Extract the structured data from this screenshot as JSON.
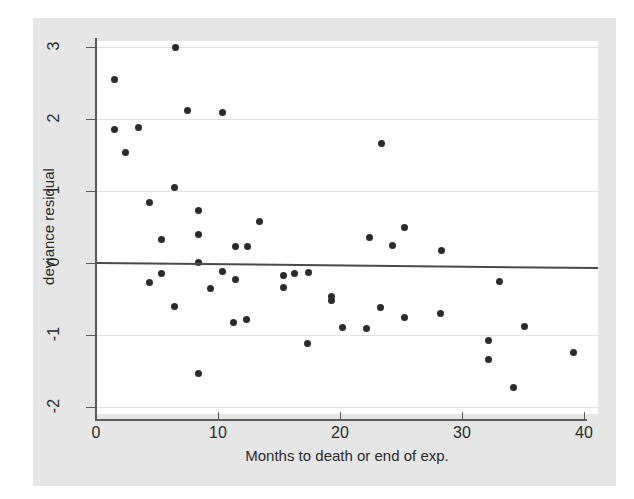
{
  "chart_data": {
    "type": "scatter",
    "title": "",
    "xlabel": "Months to death or end of exp.",
    "ylabel": "deviance residual",
    "xlim": [
      0,
      41.2
    ],
    "ylim": [
      -2.2,
      3.15
    ],
    "xticks": [
      0,
      10,
      20,
      30,
      40
    ],
    "xticklabels": [
      "0",
      "10",
      "20",
      "30",
      "40"
    ],
    "yticks": [
      3,
      2,
      1,
      0,
      -1,
      -2
    ],
    "yticklabels": [
      "3",
      "2",
      "1",
      "0",
      "-1",
      "-2"
    ],
    "grid": "horizontal",
    "legend": "none",
    "reference_line": {
      "name": "zero-reference-line",
      "y_left": 0.0,
      "y_right": -0.07,
      "color": "#4a4a4a"
    },
    "marker": {
      "shape": "circle",
      "color": "#2b2b2b",
      "size": 7
    },
    "points": [
      {
        "x": 1.5,
        "y": 2.55
      },
      {
        "x": 1.5,
        "y": 1.85
      },
      {
        "x": 2.4,
        "y": 1.53
      },
      {
        "x": 3.5,
        "y": 1.88
      },
      {
        "x": 4.4,
        "y": 0.84
      },
      {
        "x": 4.4,
        "y": -0.27
      },
      {
        "x": 5.4,
        "y": 0.33
      },
      {
        "x": 5.4,
        "y": -0.15
      },
      {
        "x": 6.4,
        "y": 1.05
      },
      {
        "x": 6.4,
        "y": -0.61
      },
      {
        "x": 6.5,
        "y": 3.0
      },
      {
        "x": 7.5,
        "y": 2.12
      },
      {
        "x": 8.4,
        "y": 0.73
      },
      {
        "x": 8.4,
        "y": 0.4
      },
      {
        "x": 8.4,
        "y": 0.01
      },
      {
        "x": 8.4,
        "y": -1.53
      },
      {
        "x": 9.4,
        "y": -0.35
      },
      {
        "x": 10.4,
        "y": 2.09
      },
      {
        "x": 10.4,
        "y": -0.12
      },
      {
        "x": 11.4,
        "y": 0.23
      },
      {
        "x": 11.4,
        "y": -0.23
      },
      {
        "x": 11.3,
        "y": -0.83
      },
      {
        "x": 12.4,
        "y": 0.23
      },
      {
        "x": 12.3,
        "y": -0.79
      },
      {
        "x": 13.4,
        "y": 0.57
      },
      {
        "x": 15.4,
        "y": -0.17
      },
      {
        "x": 15.4,
        "y": -0.34
      },
      {
        "x": 16.3,
        "y": -0.15
      },
      {
        "x": 17.4,
        "y": -0.13
      },
      {
        "x": 17.3,
        "y": -1.12
      },
      {
        "x": 19.3,
        "y": -0.47
      },
      {
        "x": 19.3,
        "y": -0.52
      },
      {
        "x": 20.2,
        "y": -0.89
      },
      {
        "x": 22.2,
        "y": -0.91
      },
      {
        "x": 22.4,
        "y": 0.36
      },
      {
        "x": 23.4,
        "y": 1.66
      },
      {
        "x": 23.3,
        "y": -0.62
      },
      {
        "x": 24.3,
        "y": 0.24
      },
      {
        "x": 25.3,
        "y": 0.5
      },
      {
        "x": 25.3,
        "y": -0.75
      },
      {
        "x": 28.3,
        "y": 0.17
      },
      {
        "x": 28.2,
        "y": -0.7
      },
      {
        "x": 32.2,
        "y": -1.08
      },
      {
        "x": 32.2,
        "y": -1.34
      },
      {
        "x": 33.1,
        "y": -0.26
      },
      {
        "x": 34.2,
        "y": -1.73
      },
      {
        "x": 35.1,
        "y": -0.88
      },
      {
        "x": 39.1,
        "y": -1.24
      }
    ]
  },
  "colors": {
    "page_background": "#ffffff",
    "panel_background": "#e6e6e6",
    "plot_background": "#ffffff",
    "axis": "#5a5a5a",
    "grid": "#e2e2e2",
    "text": "#2b2b2b",
    "marker": "#2b2b2b"
  }
}
